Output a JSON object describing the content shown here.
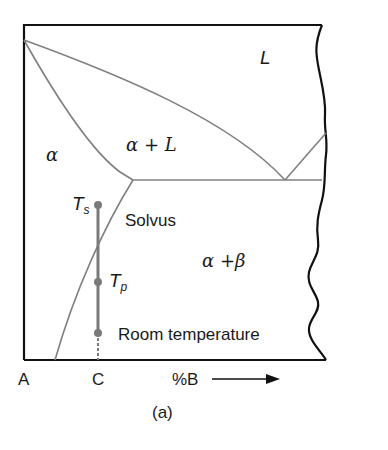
{
  "figure": {
    "caption": "(a)",
    "regions": {
      "liquid": "L",
      "alpha": "α",
      "alpha_plus_liquid": "α + L",
      "alpha_plus_beta": "α +β"
    },
    "labels": {
      "solvus": "Solvus",
      "room_temperature": "Room temperature",
      "ts_main": "T",
      "ts_sub": "s",
      "tp_main": "T",
      "tp_sub": "p"
    },
    "axis": {
      "left_component": "A",
      "composition_marker": "C",
      "x_label": "%B"
    },
    "colors": {
      "frame": "#111111",
      "phase_lines": "#808080",
      "composition_line": "#7a7a7a",
      "text": "#1a1a1a"
    },
    "points": [
      {
        "name": "Ts",
        "x": 98,
        "y": 205
      },
      {
        "name": "Tp",
        "x": 98,
        "y": 282
      },
      {
        "name": "Room temperature",
        "x": 98,
        "y": 333
      }
    ]
  }
}
